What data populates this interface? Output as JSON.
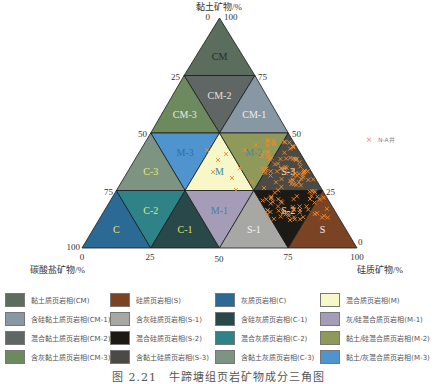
{
  "diagram": {
    "apex_label": "黏土矿物/%",
    "left_axis_label": "碳酸盐矿物/%",
    "right_axis_label": "硅质矿物/%",
    "top_ticks": {
      "left": "0",
      "right": "100"
    },
    "left_edge_ticks": [
      "25",
      "50",
      "75",
      "100"
    ],
    "right_edge_ticks": [
      "75",
      "50",
      "25",
      "0"
    ],
    "base_ticks": [
      "0",
      "25",
      "50",
      "75",
      "100"
    ],
    "series_legend": {
      "symbol": "×",
      "label": "N-A井",
      "color": "#f0892c"
    }
  },
  "regions": [
    {
      "id": "CM",
      "label": "CM",
      "fill": "#5b6e5e",
      "label_color": "#2a2a2a"
    },
    {
      "id": "CM-2",
      "label": "CM-2",
      "fill": "#5f6664",
      "label_color": "#e0e0e0"
    },
    {
      "id": "CM-3",
      "label": "CM-3",
      "fill": "#6d8a5e",
      "label_color": "#e8e8e8"
    },
    {
      "id": "CM-1",
      "label": "CM-1",
      "fill": "#8797a3",
      "label_color": "#eeeeee"
    },
    {
      "id": "M-3",
      "label": "M-3",
      "fill": "#4f94cf",
      "label_color": "#2d6fa8"
    },
    {
      "id": "M",
      "label": "M",
      "fill": "#f7f7c8",
      "label_color": "#3b8aa8"
    },
    {
      "id": "M-2",
      "label": "M-2",
      "fill": "#8f9a5a",
      "label_color": "#4c86a0"
    },
    {
      "id": "C-3",
      "label": "C-3",
      "fill": "#7e9483",
      "label_color": "#e9ea7a"
    },
    {
      "id": "S-3",
      "label": "S-3",
      "fill": "#4b4a44",
      "label_color": "#f2f2f2"
    },
    {
      "id": "C",
      "label": "C",
      "fill": "#2a6a95",
      "label_color": "#e3e66e"
    },
    {
      "id": "C-2",
      "label": "C-2",
      "fill": "#2f8288",
      "label_color": "#e3e66e"
    },
    {
      "id": "C-1",
      "label": "C-1",
      "fill": "#28484a",
      "label_color": "#dfe36a"
    },
    {
      "id": "M-1",
      "label": "M-1",
      "fill": "#a59db7",
      "label_color": "#4a7bb5"
    },
    {
      "id": "S-1",
      "label": "S-1",
      "fill": "#a7a7a3",
      "label_color": "#f3f3f3"
    },
    {
      "id": "S-2",
      "label": "S-2",
      "fill": "#1d1a16",
      "label_color": "#f3f3f3"
    },
    {
      "id": "S",
      "label": "S",
      "fill": "#7a4424",
      "label_color": "#f3f3f3"
    }
  ],
  "legend": [
    {
      "label": "黏土质页岩相(CM)",
      "color": "#5b6e5e"
    },
    {
      "label": "硅质页岩相(S)",
      "color": "#7a4424"
    },
    {
      "label": "灰质页岩相(C)",
      "color": "#2a6a95"
    },
    {
      "label": "混合质页岩相(M)",
      "color": "#f7f7c8"
    },
    {
      "label": "含硅黏土质页岩相(CM-1)",
      "color": "#8797a3"
    },
    {
      "label": "含灰硅质页岩相(S-1)",
      "color": "#a7a7a3"
    },
    {
      "label": "含硅灰质页岩相(C-1)",
      "color": "#28484a"
    },
    {
      "label": "灰/硅混合质页岩相(M-1)",
      "color": "#a59db7"
    },
    {
      "label": "混合黏土质页岩相(CM-2)",
      "color": "#5f6664"
    },
    {
      "label": "混合硅质页岩相(S-2)",
      "color": "#1d1a16"
    },
    {
      "label": "混合灰质页岩相(C-2)",
      "color": "#2f8288"
    },
    {
      "label": "黏土/硅混合质页岩相(M-2)",
      "color": "#8f9a5a"
    },
    {
      "label": "含灰黏土质页岩相(CM-3)",
      "color": "#6d8a5e"
    },
    {
      "label": "含黏土硅质页岩相(S-3)",
      "color": "#4b4a44"
    },
    {
      "label": "含黏土灰质页岩相(C-3)",
      "color": "#7e9483"
    },
    {
      "label": "黏土/灰混合质页岩相(M-3)",
      "color": "#4f94cf"
    }
  ],
  "caption": "图 2.21　牛蹄塘组页岩矿物成分三角图"
}
